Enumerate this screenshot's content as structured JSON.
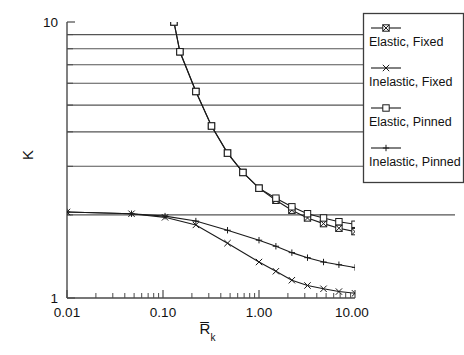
{
  "chart_data": {
    "type": "line",
    "title": "",
    "xlabel": "R̅k",
    "xlabel_main": "R̅",
    "xlabel_sub": "k",
    "ylabel": "K",
    "xscale": "log",
    "yscale": "log",
    "xlim": [
      0.01,
      10.0
    ],
    "ylim": [
      1.0,
      10.0
    ],
    "grid": true,
    "grid_orientation": "horizontal",
    "legend_position": "right-outside",
    "xticks": [
      "0.01",
      "0.10",
      "1.00",
      "10.00"
    ],
    "xtick_values": [
      0.01,
      0.1,
      1.0,
      10.0
    ],
    "yticks": [
      "10",
      "1"
    ],
    "ytick_values": [
      10,
      1
    ],
    "y_gridline_values": [
      9,
      8,
      7,
      6,
      5,
      4,
      3,
      2
    ],
    "series": [
      {
        "name": "Elastic, Fixed",
        "marker": "boxed-x",
        "x": [
          0.13,
          0.15,
          0.22,
          0.32,
          0.47,
          0.68,
          1.0,
          1.5,
          2.2,
          3.2,
          4.7,
          6.8,
          10.0
        ],
        "y": [
          10.0,
          7.8,
          5.6,
          4.2,
          3.35,
          2.85,
          2.5,
          2.26,
          2.08,
          1.95,
          1.86,
          1.79,
          1.74
        ]
      },
      {
        "name": "Inelastic, Fixed",
        "marker": "x",
        "x": [
          0.01,
          0.047,
          0.105,
          0.22,
          0.47,
          1.0,
          1.5,
          2.2,
          3.2,
          4.7,
          6.8,
          10.0
        ],
        "y": [
          2.05,
          2.02,
          1.96,
          1.84,
          1.58,
          1.35,
          1.25,
          1.16,
          1.11,
          1.08,
          1.055,
          1.04
        ]
      },
      {
        "name": "Elastic, Pinned",
        "marker": "square",
        "x": [
          0.13,
          0.15,
          0.22,
          0.32,
          0.47,
          0.68,
          1.0,
          1.5,
          2.2,
          3.2,
          4.7,
          6.8,
          10.0
        ],
        "y": [
          10.0,
          7.8,
          5.6,
          4.2,
          3.35,
          2.85,
          2.5,
          2.3,
          2.14,
          2.02,
          1.95,
          1.89,
          1.85
        ]
      },
      {
        "name": "Inelastic, Pinned",
        "marker": "plus",
        "x": [
          0.01,
          0.047,
          0.105,
          0.22,
          0.47,
          1.0,
          1.5,
          2.2,
          3.2,
          4.7,
          6.8,
          10.0
        ],
        "y": [
          2.05,
          2.02,
          1.98,
          1.9,
          1.76,
          1.62,
          1.54,
          1.46,
          1.4,
          1.35,
          1.32,
          1.29
        ]
      }
    ]
  },
  "legend": {
    "entries": [
      {
        "label": "Elastic, Fixed",
        "marker": "boxed-x"
      },
      {
        "label": "Inelastic, Fixed",
        "marker": "x"
      },
      {
        "label": "Elastic, Pinned",
        "marker": "square"
      },
      {
        "label": "Inelastic, Pinned",
        "marker": "plus"
      }
    ]
  },
  "axes": {
    "x_tick_labels": [
      "0.01",
      "0.10",
      "1.00",
      "10.00"
    ],
    "y_tick_labels": [
      "10",
      "1"
    ],
    "x_title_main": "R̅",
    "x_title_sub": "k",
    "y_title": "K"
  },
  "colors": {
    "background": "#ffffff",
    "line": "#1a1a1a",
    "grid": "#555555",
    "axis": "#4a4a4a",
    "text": "#111111"
  }
}
